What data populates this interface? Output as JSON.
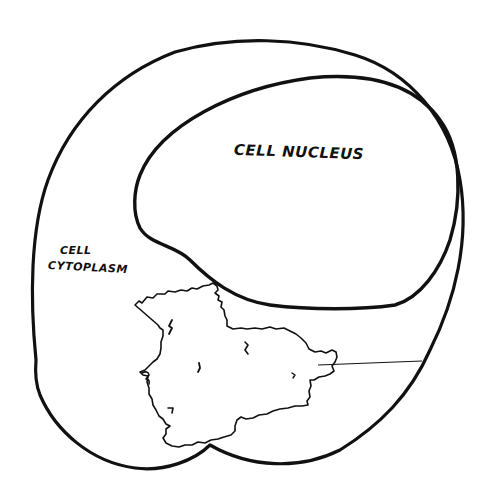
{
  "diagram": {
    "type": "hand-drawn cell illustration",
    "colors": {
      "ink": "#111111",
      "background": "#ffffff"
    },
    "labels": {
      "nucleus": "CELL NUCLEUS",
      "cytoplasm_line1": "CELL",
      "cytoplasm_line2": "CYTOPLASM"
    },
    "shapes": [
      {
        "name": "cell-membrane",
        "description": "outer cell boundary"
      },
      {
        "name": "nucleus",
        "description": "large kidney-shaped nucleus, upper right"
      },
      {
        "name": "irregular-organelle",
        "description": "rough-edged blob in lower half with leader line pointing right to the membrane"
      }
    ]
  }
}
